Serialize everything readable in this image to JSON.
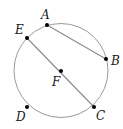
{
  "diagram": {
    "type": "circle-geometry",
    "circle": {
      "cx": 61,
      "cy": 70.5,
      "r": 47,
      "stroke": "#9a9a9a"
    },
    "points": [
      {
        "id": "A",
        "label": "A",
        "x": 47,
        "y": 25,
        "lx": 41,
        "ly": 19
      },
      {
        "id": "B",
        "label": "B",
        "x": 106,
        "y": 59,
        "lx": 111,
        "ly": 65
      },
      {
        "id": "C",
        "label": "C",
        "x": 94,
        "y": 107,
        "lx": 96,
        "ly": 120
      },
      {
        "id": "D",
        "label": "D",
        "x": 27,
        "y": 107,
        "lx": 16,
        "ly": 121
      },
      {
        "id": "E",
        "label": "E",
        "x": 27,
        "y": 38,
        "lx": 15,
        "ly": 34
      },
      {
        "id": "F",
        "label": "F",
        "x": 61,
        "y": 71,
        "lx": 52,
        "ly": 86
      }
    ],
    "segments": [
      {
        "from": "A",
        "to": "B",
        "stroke": "#8a8a8a"
      },
      {
        "from": "E",
        "to": "C",
        "stroke": "#8a8a8a"
      }
    ],
    "point_color": "#000000"
  }
}
